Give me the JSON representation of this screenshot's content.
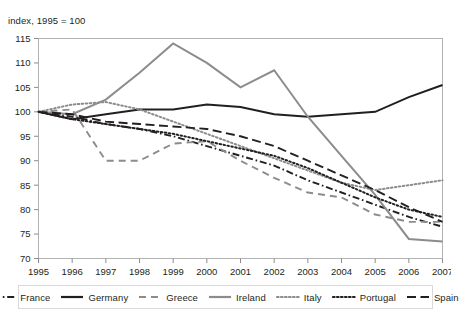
{
  "axis_note": "index, 1995 = 100",
  "legend": {
    "items": [
      {
        "label": "France",
        "key": "France"
      },
      {
        "label": "Germany",
        "key": "Germany"
      },
      {
        "label": "Greece",
        "key": "Greece"
      },
      {
        "label": "Ireland",
        "key": "Ireland"
      },
      {
        "label": "Italy",
        "key": "Italy"
      },
      {
        "label": "Portugal",
        "key": "Portugal"
      },
      {
        "label": "Spain",
        "key": "Spain"
      }
    ]
  },
  "chart_data": {
    "type": "line",
    "title": "",
    "subtitle": "",
    "xlabel": "",
    "ylabel": "index, 1995 = 100",
    "categories": [
      1995,
      1996,
      1997,
      1998,
      1999,
      2000,
      2001,
      2002,
      2003,
      2004,
      2005,
      2006,
      2007
    ],
    "x": [
      "1995",
      "1996",
      "1997",
      "1998",
      "1999",
      "2000",
      "2001",
      "2002",
      "2003",
      "2004",
      "2005",
      "2006",
      "2007"
    ],
    "xlim": [
      1995,
      2007
    ],
    "ylim": [
      70,
      115
    ],
    "yticks": [
      70,
      75,
      80,
      85,
      90,
      95,
      100,
      105,
      110,
      115
    ],
    "grid": false,
    "legend_position": "bottom",
    "series": [
      {
        "name": "France",
        "color": "#231f20",
        "style": "dash-dot",
        "values": [
          100.0,
          99.0,
          97.5,
          96.5,
          95.0,
          93.0,
          91.0,
          89.0,
          86.0,
          83.5,
          81.0,
          78.5,
          76.5
        ]
      },
      {
        "name": "Germany",
        "color": "#231f20",
        "style": "solid",
        "values": [
          100.0,
          98.5,
          99.5,
          100.5,
          100.5,
          101.5,
          101.0,
          99.5,
          99.0,
          99.5,
          100.0,
          103.0,
          105.5
        ]
      },
      {
        "name": "Greece",
        "color": "#8c8c8c",
        "style": "dashed",
        "values": [
          100.0,
          100.5,
          90.0,
          90.0,
          93.5,
          94.0,
          90.0,
          86.5,
          83.5,
          82.5,
          79.0,
          77.5,
          77.5
        ]
      },
      {
        "name": "Ireland",
        "color": "#8c8c8c",
        "style": "solid",
        "values": [
          100.0,
          99.5,
          102.5,
          108.0,
          114.0,
          110.0,
          105.0,
          108.5,
          99.0,
          91.0,
          83.0,
          74.0,
          73.5
        ]
      },
      {
        "name": "Italy",
        "color": "#8c8c8c",
        "style": "dotted",
        "values": [
          100.0,
          101.5,
          102.0,
          100.5,
          98.0,
          95.5,
          93.0,
          90.5,
          88.0,
          85.5,
          84.0,
          85.0,
          86.0
        ]
      },
      {
        "name": "Portugal",
        "color": "#231f20",
        "style": "dotted",
        "values": [
          100.0,
          98.5,
          97.5,
          96.5,
          95.5,
          94.0,
          92.5,
          91.0,
          88.5,
          85.5,
          82.5,
          80.0,
          78.5
        ]
      },
      {
        "name": "Spain",
        "color": "#231f20",
        "style": "long-dash",
        "values": [
          100.0,
          99.5,
          98.0,
          97.5,
          97.0,
          96.5,
          95.0,
          93.0,
          90.0,
          87.0,
          84.0,
          80.5,
          77.5
        ]
      }
    ]
  }
}
